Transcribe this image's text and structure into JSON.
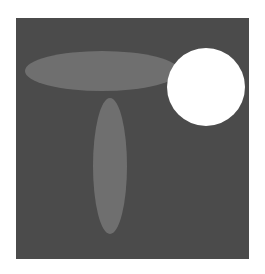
{
  "image": {
    "description": "Dark gray square containing a horizontal gray ellipse, a vertical gray ellipse, and a white circle",
    "page_background": "#ffffff",
    "panel": {
      "x": 16,
      "y": 18,
      "width": 233,
      "height": 241,
      "color": "#4b4b4b"
    },
    "shapes": [
      {
        "type": "ellipse",
        "name": "horizontal-ellipse",
        "cx": 102,
        "cy": 71,
        "rx": 77,
        "ry": 20,
        "color": "#6f6f6f"
      },
      {
        "type": "ellipse",
        "name": "vertical-ellipse",
        "cx": 110,
        "cy": 166,
        "rx": 17,
        "ry": 68,
        "color": "#6f6f6f"
      },
      {
        "type": "circle",
        "name": "white-circle",
        "cx": 206,
        "cy": 87,
        "r": 39,
        "color": "#ffffff"
      }
    ]
  }
}
